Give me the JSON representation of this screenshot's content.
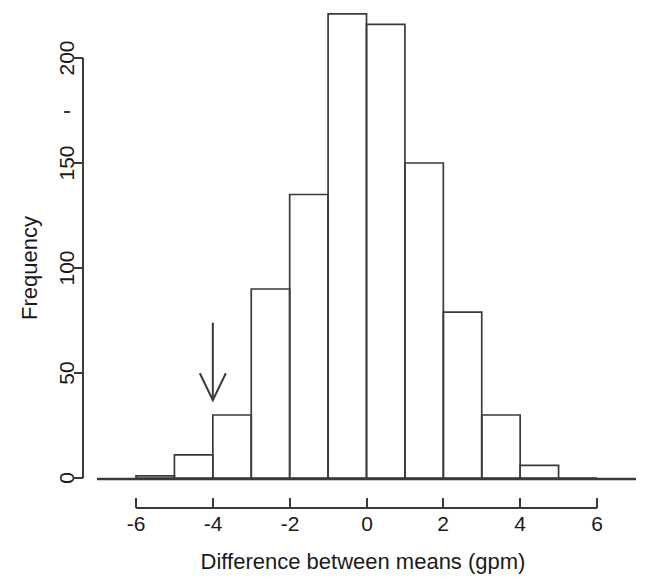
{
  "chart_data": {
    "type": "bar",
    "subtype": "histogram",
    "title": "",
    "xlabel": "Difference between means (gpm)",
    "ylabel": "Frequency",
    "xlim": [
      -6,
      6
    ],
    "ylim": [
      0,
      225
    ],
    "grid": false,
    "legend": null,
    "bin_width": 1,
    "bin_edges": [
      -6,
      -5,
      -4,
      -3,
      -2,
      -1,
      0,
      1,
      2,
      3,
      4,
      5,
      6
    ],
    "categories": [
      "-6 to -5",
      "-5 to -4",
      "-4 to -3",
      "-3 to -2",
      "-2 to -1",
      "-1 to 0",
      "0 to 1",
      "1 to 2",
      "2 to 3",
      "3 to 4",
      "4 to 5",
      "5 to 6"
    ],
    "values": [
      1,
      11,
      30,
      90,
      135,
      221,
      216,
      150,
      79,
      30,
      6,
      0
    ],
    "xticks": [
      -6,
      -4,
      -2,
      0,
      2,
      4,
      6
    ],
    "xtick_labels": [
      "-6",
      "-4",
      "-2",
      "0",
      "2",
      "4",
      "6"
    ],
    "yticks": [
      0,
      50,
      100,
      150,
      200
    ],
    "ytick_labels": [
      "0",
      "50",
      "100",
      "150",
      "200"
    ],
    "annotations": [
      {
        "name": "reference-arrow",
        "type": "down-arrow",
        "x": -4.0,
        "y_top": 74,
        "y_tip": 37,
        "label": ""
      }
    ]
  },
  "figure": {
    "background_color": "#ffffff",
    "line_color": "#3a3a3a",
    "text_color": "#1a1a1a"
  }
}
